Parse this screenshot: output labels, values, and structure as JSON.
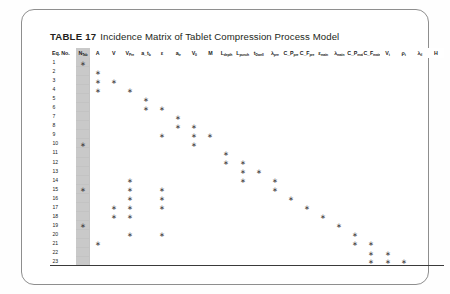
{
  "document": {
    "caption_lead": "TABLE 17",
    "caption_title": "Incidence Matrix of Tablet Compression Process Model"
  },
  "table": {
    "eq_col_header": "Eq. No.",
    "columns": [
      {
        "base": "N",
        "sub": "Tab",
        "shaded": true
      },
      {
        "base": "A",
        "sub": "",
        "shaded": false
      },
      {
        "base": "V",
        "sub": "",
        "shaded": false
      },
      {
        "base": "V",
        "sub": "Pre",
        "shaded": false
      },
      {
        "base": "a_t",
        "sub": "b",
        "shaded": false
      },
      {
        "base": "ε",
        "sub": "",
        "shaded": false
      },
      {
        "base": "a",
        "sub": "tr",
        "shaded": false
      },
      {
        "base": "V",
        "sub": "0",
        "shaded": false
      },
      {
        "base": "M",
        "sub": "",
        "shaded": false
      },
      {
        "base": "L",
        "sub": "depth",
        "shaded": false
      },
      {
        "base": "L",
        "sub": "punch",
        "shaded": false
      },
      {
        "base": "t",
        "sub": "Dwell",
        "shaded": false
      },
      {
        "base": "λ",
        "sub": "pre",
        "shaded": false
      },
      {
        "base": "C_P",
        "sub": "pre",
        "shaded": false
      },
      {
        "base": "C_F",
        "sub": "pre",
        "shaded": false
      },
      {
        "base": "ε",
        "sub": "main",
        "shaded": false
      },
      {
        "base": "λ",
        "sub": "main",
        "shaded": false
      },
      {
        "base": "C_P",
        "sub": "main",
        "shaded": false
      },
      {
        "base": "C_F",
        "sub": "main",
        "shaded": false
      },
      {
        "base": "V",
        "sub": "t",
        "shaded": false
      },
      {
        "base": "ρ",
        "sub": "t",
        "shaded": false
      },
      {
        "base": "λ",
        "sub": "tl",
        "shaded": false
      },
      {
        "base": "H",
        "sub": "",
        "shaded": false
      }
    ],
    "rows": [
      {
        "eq": "1",
        "stars": [
          0
        ]
      },
      {
        "eq": "2",
        "stars": [
          1
        ]
      },
      {
        "eq": "3",
        "stars": [
          1,
          2
        ]
      },
      {
        "eq": "4",
        "stars": [
          1,
          3
        ]
      },
      {
        "eq": "5",
        "stars": [
          4
        ]
      },
      {
        "eq": "6",
        "stars": [
          4,
          5
        ]
      },
      {
        "eq": "7",
        "stars": [
          6
        ]
      },
      {
        "eq": "8",
        "stars": [
          6,
          7
        ]
      },
      {
        "eq": "9",
        "stars": [
          5,
          7,
          8
        ]
      },
      {
        "eq": "10",
        "stars": [
          0,
          7
        ]
      },
      {
        "eq": "11",
        "stars": [
          9
        ]
      },
      {
        "eq": "12",
        "stars": [
          9,
          10
        ]
      },
      {
        "eq": "13",
        "stars": [
          10,
          11
        ]
      },
      {
        "eq": "14",
        "stars": [
          3,
          10,
          12
        ]
      },
      {
        "eq": "15",
        "stars": [
          0,
          3,
          5,
          12
        ]
      },
      {
        "eq": "16",
        "stars": [
          3,
          5,
          13
        ]
      },
      {
        "eq": "17",
        "stars": [
          2,
          3,
          5,
          14
        ]
      },
      {
        "eq": "18",
        "stars": [
          2,
          3,
          15
        ]
      },
      {
        "eq": "19",
        "stars": [
          0,
          16
        ]
      },
      {
        "eq": "20",
        "stars": [
          3,
          5,
          17
        ]
      },
      {
        "eq": "21",
        "stars": [
          1,
          17,
          18
        ]
      },
      {
        "eq": "22",
        "stars": [
          18,
          19
        ]
      },
      {
        "eq": "23",
        "stars": [
          18,
          19,
          20
        ]
      }
    ]
  }
}
